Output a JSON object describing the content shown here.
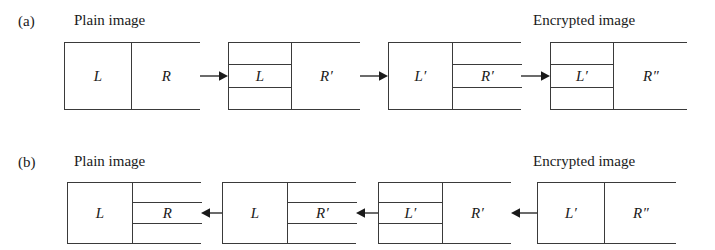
{
  "figure": {
    "rows": [
      {
        "tag": "(a)",
        "tag_x": 18,
        "tag_y": 14,
        "direction": "left-to-right",
        "left_caption": "Plain image",
        "left_caption_x": 74,
        "right_caption": "Encrypted image",
        "right_caption_x": 533,
        "caption_y": 13,
        "box_top": 42,
        "box_height": 68,
        "boxes": [
          {
            "name": "plain-image-block",
            "x": 64,
            "width": 136,
            "cells": [
              {
                "name": "left-half",
                "label": "L",
                "width": 66,
                "banded": false
              },
              {
                "name": "right-half",
                "label": "R",
                "width": 70,
                "banded": false
              }
            ]
          },
          {
            "name": "round-one-block",
            "x": 228,
            "width": 132,
            "cells": [
              {
                "name": "left-half",
                "label": "L",
                "width": 62,
                "banded": true
              },
              {
                "name": "right-half",
                "label": "R′",
                "width": 70,
                "banded": false
              }
            ]
          },
          {
            "name": "round-two-block",
            "x": 388,
            "width": 133,
            "cells": [
              {
                "name": "left-half",
                "label": "L′",
                "width": 63,
                "banded": false
              },
              {
                "name": "right-half",
                "label": "R′",
                "width": 70,
                "banded": true
              }
            ]
          },
          {
            "name": "encrypted-image-block",
            "x": 550,
            "width": 137,
            "cells": [
              {
                "name": "left-half",
                "label": "L′",
                "width": 62,
                "banded": true
              },
              {
                "name": "right-half",
                "label": "R″",
                "width": 75,
                "banded": false
              }
            ]
          }
        ],
        "arrows": [
          {
            "name": "arrow-1",
            "x": 200,
            "width": 28,
            "y": 76,
            "dir": "right"
          },
          {
            "name": "arrow-2",
            "x": 360,
            "width": 28,
            "y": 76,
            "dir": "right"
          },
          {
            "name": "arrow-3",
            "x": 521,
            "width": 29,
            "y": 76,
            "dir": "right"
          }
        ]
      },
      {
        "tag": "(b)",
        "tag_x": 18,
        "tag_y": 155,
        "direction": "right-to-left",
        "left_caption": "Plain image",
        "left_caption_x": 74,
        "right_caption": "Encrypted image",
        "right_caption_x": 533,
        "caption_y": 154,
        "box_top": 182,
        "box_height": 62,
        "boxes": [
          {
            "name": "plain-image-block",
            "x": 67,
            "width": 134,
            "cells": [
              {
                "name": "left-half",
                "label": "L",
                "width": 64,
                "banded": false
              },
              {
                "name": "right-half",
                "label": "R",
                "width": 70,
                "banded": true
              }
            ]
          },
          {
            "name": "round-one-block",
            "x": 222,
            "width": 134,
            "cells": [
              {
                "name": "left-half",
                "label": "L",
                "width": 64,
                "banded": false
              },
              {
                "name": "right-half",
                "label": "R′",
                "width": 70,
                "banded": true
              }
            ]
          },
          {
            "name": "round-two-block",
            "x": 378,
            "width": 133,
            "cells": [
              {
                "name": "left-half",
                "label": "L′",
                "width": 63,
                "banded": true
              },
              {
                "name": "right-half",
                "label": "R′",
                "width": 70,
                "banded": false
              }
            ]
          },
          {
            "name": "encrypted-image-block",
            "x": 537,
            "width": 139,
            "cells": [
              {
                "name": "left-half",
                "label": "L′",
                "width": 66,
                "banded": false
              },
              {
                "name": "right-half",
                "label": "R″",
                "width": 73,
                "banded": false
              }
            ]
          }
        ],
        "arrows": [
          {
            "name": "arrow-1",
            "x": 201,
            "width": 21,
            "y": 213,
            "dir": "left"
          },
          {
            "name": "arrow-2",
            "x": 356,
            "width": 22,
            "y": 213,
            "dir": "left"
          },
          {
            "name": "arrow-3",
            "x": 511,
            "width": 26,
            "y": 213,
            "dir": "left"
          }
        ]
      }
    ]
  }
}
